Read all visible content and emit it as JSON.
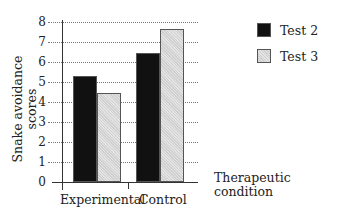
{
  "chart_data": {
    "type": "bar",
    "title": "",
    "xlabel": "Therapeutic condition",
    "ylabel": "Snake avoidance scores",
    "categories": [
      "Experimental",
      "Control"
    ],
    "series": [
      {
        "name": "Test 2",
        "values": [
          5.3,
          6.45
        ],
        "color": "#111111"
      },
      {
        "name": "Test 3",
        "values": [
          4.45,
          7.65
        ],
        "color": "#d8d8d8"
      }
    ],
    "ylim": [
      0,
      8
    ],
    "yticks": [
      "0",
      "1",
      "2",
      "3",
      "4",
      "5",
      "6",
      "7",
      "8"
    ],
    "grid": true,
    "legend_position": "top-right"
  },
  "legend": {
    "items": [
      {
        "label": "Test 2"
      },
      {
        "label": "Test 3"
      }
    ]
  }
}
